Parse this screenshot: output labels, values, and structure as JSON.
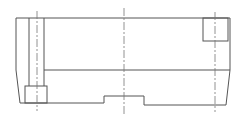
{
  "drawing": {
    "type": "technical-section-view",
    "colors": {
      "background": "#ffffff",
      "outline": "#555555",
      "centerline": "#777777"
    },
    "labels": []
  }
}
